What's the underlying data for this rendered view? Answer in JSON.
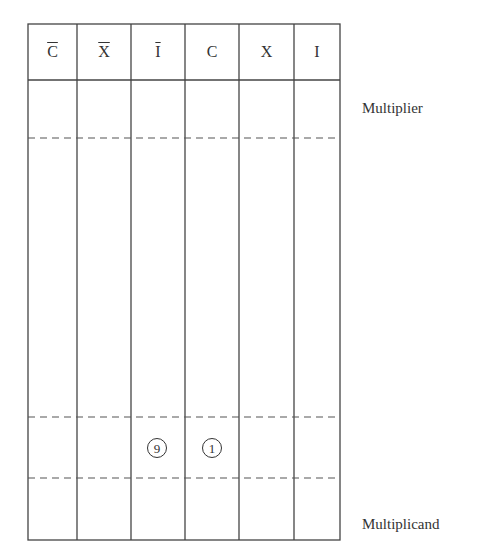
{
  "table": {
    "columns": [
      {
        "label": "C",
        "overline": true
      },
      {
        "label": "X",
        "overline": true
      },
      {
        "label": "I",
        "overline": true
      },
      {
        "label": "C",
        "overline": false
      },
      {
        "label": "X",
        "overline": false
      },
      {
        "label": "I",
        "overline": false
      }
    ],
    "col0": "C",
    "col1": "X",
    "col2": "I",
    "col3": "C",
    "col4": "X",
    "col5": "I"
  },
  "labels": {
    "multiplier": "Multiplier",
    "multiplicand": "Multiplicand"
  },
  "circled_values": {
    "col2": "9",
    "col3": "1"
  }
}
